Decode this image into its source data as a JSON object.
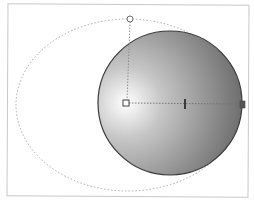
{
  "canvas": {
    "background": "#ffffff",
    "frame_border_color": "#c8c8c8"
  },
  "shapes": {
    "guide_ellipse": {
      "cx": 128,
      "cy": 105,
      "rx": 112,
      "ry": 86,
      "stroke": "#9a9a9a",
      "style": "dotted"
    },
    "circle": {
      "cx": 170,
      "cy": 103,
      "r": 72,
      "stroke": "#3a3a3a",
      "gradient": {
        "type": "radial",
        "center_x": 126,
        "center_y": 103,
        "stops": [
          {
            "offset": "0%",
            "color": "#ffffff"
          },
          {
            "offset": "35%",
            "color": "#c4c4c4"
          },
          {
            "offset": "100%",
            "color": "#6e6e6e"
          }
        ]
      }
    }
  },
  "gradient_handles": {
    "center_handle": {
      "x": 126,
      "y": 103,
      "shape": "square"
    },
    "top_handle": {
      "x": 130,
      "y": 19,
      "shape": "circle"
    },
    "mid_tick": {
      "x": 185,
      "y": 104,
      "shape": "tick"
    },
    "end_handle": {
      "x": 242,
      "y": 104,
      "shape": "square"
    },
    "line_color": "#8a8a8a"
  },
  "icons": {
    "center_handle_icon": "square-handle-icon",
    "top_handle_icon": "circle-handle-icon",
    "end_handle_icon": "square-handle-icon",
    "mid_tick_icon": "tick-mark-icon"
  }
}
